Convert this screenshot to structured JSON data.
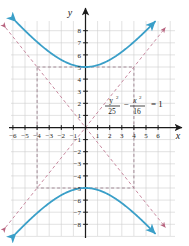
{
  "figure": {
    "background_color": "#ffffff",
    "grid_color": "#cfcfcf",
    "axis_color": "#1a1a1a",
    "curve_color": "#3a9fc8",
    "asymptote_color": "#c98aa0",
    "dash_color": "#9a7f8c"
  },
  "axes": {
    "x_label": "x",
    "y_label": "y",
    "x_ticks": [
      "-6",
      "-5",
      "-4",
      "-3",
      "-2",
      "-1",
      "1",
      "2",
      "3",
      "4",
      "5",
      "6"
    ],
    "y_ticks": [
      "8",
      "7",
      "6",
      "5",
      "4",
      "3",
      "2",
      "1",
      "-1",
      "-2",
      "-3",
      "-4",
      "-5",
      "-6",
      "-7",
      "-8"
    ],
    "xlim": [
      -7,
      7
    ],
    "ylim": [
      -9,
      9
    ],
    "grid": true
  },
  "equation": {
    "y_var": "y",
    "y_exp": "2",
    "y_den": "25",
    "minus": "−",
    "x_var": "x",
    "x_exp": "2",
    "x_den": "16",
    "equals": "= 1",
    "full": "y²/25 − x²/16 = 1"
  },
  "chart_data": {
    "type": "line",
    "xlabel": "x",
    "ylabel": "y",
    "xlim": [
      -7,
      7
    ],
    "ylim": [
      -9,
      9
    ],
    "grid": true,
    "legend_position": "none",
    "a": 5,
    "b": 4,
    "center": [
      0,
      0
    ],
    "vertices": [
      [
        0,
        5
      ],
      [
        0,
        -5
      ]
    ],
    "annotations": [
      {
        "text": "y²/25 − x²/16 = 1",
        "x": 2.6,
        "y": 1.7
      }
    ],
    "series": [
      {
        "name": "upper branch",
        "color": "#3a9fc8",
        "style": "solid",
        "arrows": "both",
        "points": [
          [
            -5.6,
            8.6
          ],
          [
            -5.0,
            7.9
          ],
          [
            -4.5,
            7.4
          ],
          [
            -4.0,
            8.0
          ],
          [
            -3.5,
            6.1
          ],
          [
            -3.0,
            5.83
          ],
          [
            -2.5,
            5.59
          ],
          [
            -2.0,
            5.39
          ],
          [
            -1.5,
            5.22
          ],
          [
            -1.0,
            5.1
          ],
          [
            -0.5,
            5.02
          ],
          [
            0.0,
            5.0
          ],
          [
            0.5,
            5.02
          ],
          [
            1.0,
            5.1
          ],
          [
            1.5,
            5.22
          ],
          [
            2.0,
            5.39
          ],
          [
            2.5,
            5.59
          ],
          [
            3.0,
            5.83
          ],
          [
            3.5,
            6.1
          ],
          [
            4.0,
            6.4
          ],
          [
            4.5,
            7.4
          ],
          [
            5.0,
            7.9
          ],
          [
            5.6,
            8.6
          ]
        ]
      },
      {
        "name": "lower branch",
        "color": "#3a9fc8",
        "style": "solid",
        "arrows": "both",
        "points": [
          [
            -5.6,
            -8.6
          ],
          [
            -5.0,
            -7.9
          ],
          [
            -4.5,
            -7.4
          ],
          [
            -4.0,
            -6.4
          ],
          [
            -3.5,
            -6.1
          ],
          [
            -3.0,
            -5.83
          ],
          [
            -2.5,
            -5.59
          ],
          [
            -2.0,
            -5.39
          ],
          [
            -1.5,
            -5.22
          ],
          [
            -1.0,
            -5.1
          ],
          [
            -0.5,
            -5.02
          ],
          [
            0.0,
            -5.0
          ],
          [
            0.5,
            -5.02
          ],
          [
            1.0,
            -5.1
          ],
          [
            1.5,
            -5.22
          ],
          [
            2.0,
            -5.39
          ],
          [
            2.5,
            -5.59
          ],
          [
            3.0,
            -5.83
          ],
          [
            3.5,
            -6.1
          ],
          [
            4.0,
            -6.4
          ],
          [
            4.5,
            -7.4
          ],
          [
            5.0,
            -7.9
          ],
          [
            5.6,
            -8.6
          ]
        ]
      },
      {
        "name": "asymptote y = 5x/4",
        "color": "#c98aa0",
        "style": "dashed",
        "arrows": "both",
        "points": [
          [
            -6.6,
            -8.25
          ],
          [
            6.6,
            8.25
          ]
        ]
      },
      {
        "name": "asymptote y = -5x/4",
        "color": "#c98aa0",
        "style": "dashed",
        "arrows": "both",
        "points": [
          [
            -6.6,
            8.25
          ],
          [
            6.6,
            -8.25
          ]
        ]
      },
      {
        "name": "reference rectangle",
        "color": "#9a7f8c",
        "style": "dashed",
        "arrows": "none",
        "points": [
          [
            -4,
            5
          ],
          [
            4,
            5
          ],
          [
            4,
            -5
          ],
          [
            -4,
            -5
          ],
          [
            -4,
            5
          ]
        ]
      }
    ]
  }
}
